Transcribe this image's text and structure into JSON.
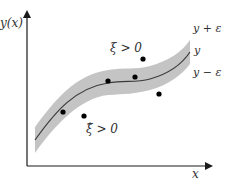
{
  "diagram": {
    "axes": {
      "y_label": "y(x)",
      "x_label": "x"
    },
    "band_labels": {
      "upper": "y + ε",
      "center": "y",
      "lower": "y − ε"
    },
    "slack_labels": {
      "xi": "ξ > 0",
      "xi_hat": "ξ̂ > 0"
    },
    "colors": {
      "band": "#c4c4c4",
      "curve": "#3a3a3a",
      "axes": "#1a1a1a",
      "points": "#000000",
      "background": "#ffffff"
    },
    "points": [
      {
        "x": 63,
        "y": 112,
        "position": "inside-tube"
      },
      {
        "x": 84,
        "y": 116,
        "position": "below-tube"
      },
      {
        "x": 108,
        "y": 81,
        "position": "on-curve"
      },
      {
        "x": 135,
        "y": 77,
        "position": "on-curve"
      },
      {
        "x": 143,
        "y": 59,
        "position": "above-tube"
      },
      {
        "x": 159,
        "y": 94,
        "position": "below-tube"
      }
    ]
  }
}
